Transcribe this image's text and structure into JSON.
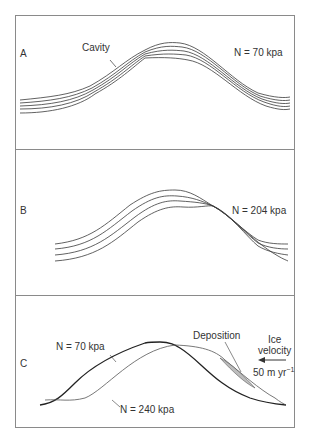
{
  "panels": {
    "a": {
      "label": "A",
      "pressure_label": "N = 70 kpa",
      "annotation": "Cavity"
    },
    "b": {
      "label": "B",
      "pressure_label": "N = 204 kpa"
    },
    "c": {
      "label": "C",
      "upper_profile_label": "N = 70 kpa",
      "lower_profile_label": "N = 240 kpa",
      "annotation": "Deposition",
      "ice_velocity_title_1": "Ice",
      "ice_velocity_title_2": "velocity",
      "ice_velocity_value": "50 m yr",
      "ice_velocity_exp": "−1",
      "arrow_direction": "left"
    }
  },
  "colors": {
    "line": "#3a3a3a",
    "border": "#8a8a8a",
    "fill_cavity": "#bdbdbd"
  }
}
